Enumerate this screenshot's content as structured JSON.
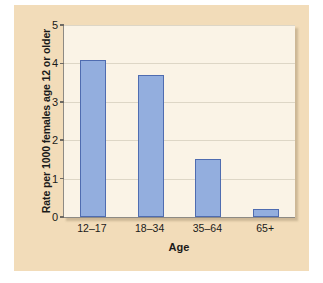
{
  "chart_data": {
    "type": "bar",
    "title": "",
    "subtitle": "",
    "xlabel": "Age",
    "ylabel": "Rate per 1000 females age 12 or older",
    "categories": [
      "12–17",
      "18–34",
      "35–64",
      "65+"
    ],
    "values": [
      4.1,
      3.7,
      1.5,
      0.2
    ],
    "series": [
      {
        "name": "Rate per 1000 females age 12 or older",
        "values": [
          4.1,
          3.7,
          1.5,
          0.2
        ]
      }
    ],
    "ylim": [
      0,
      5
    ],
    "yticks": [
      0,
      1,
      2,
      3,
      4,
      5
    ],
    "ytick_labels": [
      "0",
      "1",
      "2",
      "3",
      "4",
      "5"
    ],
    "grid": true,
    "grid_axis": "y",
    "legend": false,
    "legend_position": "none",
    "annotations": [],
    "colors": {
      "bar_fill": "#93aede",
      "bar_border": "#4f6cb0",
      "plot_background": "#faf3e6",
      "figure_background": "#f2dcb9",
      "gridline": "#ddd6c6",
      "axis_line": "#8d8a84",
      "text": "#1a1a1a"
    }
  }
}
